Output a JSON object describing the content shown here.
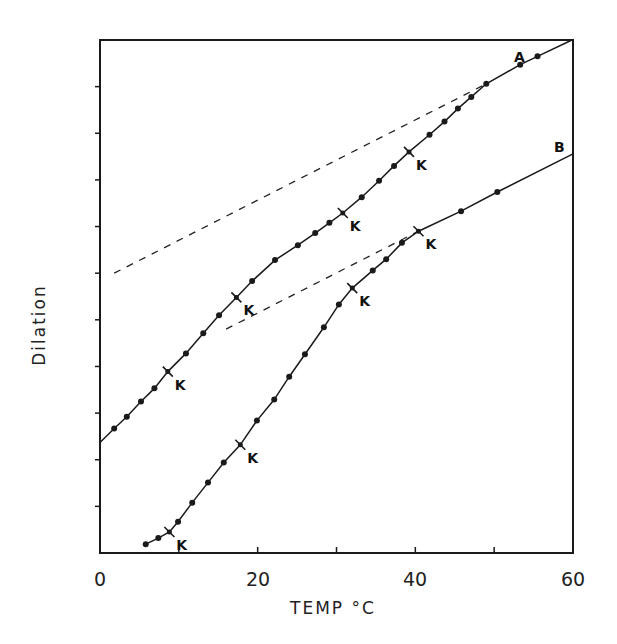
{
  "chart_data": {
    "type": "line",
    "title": "",
    "xlabel": "TEMP °C",
    "ylabel": "Dilation",
    "xlim": [
      0,
      60
    ],
    "ylim": [
      0,
      11
    ],
    "x_ticks": [
      0,
      10,
      20,
      30,
      40,
      50,
      60
    ],
    "x_tick_labels": [
      "0",
      "20",
      "40",
      "60"
    ],
    "x_tick_label_values": [
      0,
      20,
      40,
      60
    ],
    "y_ticks": [
      1,
      2,
      3,
      4,
      5,
      6,
      7,
      8,
      9,
      10
    ],
    "y_tick_labels": [],
    "grid": false,
    "legend": "none (curves labeled inline)",
    "series": [
      {
        "name": "A",
        "style": "solid line with dot markers",
        "x": [
          0,
          1.8,
          3.4,
          5.2,
          6.9,
          8.6,
          10.9,
          13.1,
          15.1,
          17.3,
          19.3,
          22.2,
          25.1,
          27.3,
          29.1,
          30.8,
          33.2,
          35.4,
          37.3,
          39.2,
          41.8,
          43.7,
          45.4,
          47.1,
          49.0,
          53.3,
          55.5,
          60
        ],
        "y": [
          2.37,
          2.67,
          2.92,
          3.25,
          3.53,
          3.89,
          4.28,
          4.71,
          5.1,
          5.48,
          5.83,
          6.28,
          6.6,
          6.86,
          7.08,
          7.29,
          7.63,
          7.98,
          8.3,
          8.6,
          8.97,
          9.25,
          9.53,
          9.78,
          10.06,
          10.47,
          10.65,
          11.01
        ],
        "markers_at_index": [
          1,
          2,
          3,
          4,
          6,
          7,
          8,
          10,
          11,
          12,
          13,
          14,
          16,
          17,
          18,
          20,
          21,
          22,
          23,
          24,
          25,
          26
        ],
        "k_points": [
          {
            "x": 8.6,
            "y": 3.89
          },
          {
            "x": 17.3,
            "y": 5.48
          },
          {
            "x": 30.8,
            "y": 7.29
          },
          {
            "x": 39.2,
            "y": 8.6
          }
        ]
      },
      {
        "name": "B",
        "style": "solid line with dot markers",
        "x": [
          5.8,
          7.4,
          8.8,
          9.9,
          11.7,
          13.7,
          15.7,
          17.8,
          19.9,
          22.1,
          24.0,
          26.0,
          28.4,
          30.3,
          32.0,
          34.6,
          36.3,
          38.3,
          40.4,
          45.8,
          50.4,
          60
        ],
        "y": [
          0.19,
          0.32,
          0.45,
          0.67,
          1.08,
          1.51,
          1.94,
          2.32,
          2.84,
          3.29,
          3.78,
          4.26,
          4.84,
          5.33,
          5.68,
          6.06,
          6.3,
          6.65,
          6.9,
          7.33,
          7.74,
          8.56
        ],
        "markers_at_index": [
          0,
          1,
          3,
          4,
          5,
          6,
          8,
          9,
          10,
          11,
          12,
          13,
          15,
          16,
          17,
          19,
          20
        ],
        "k_points": [
          {
            "x": 8.8,
            "y": 0.45
          },
          {
            "x": 17.8,
            "y": 2.32
          },
          {
            "x": 32.0,
            "y": 5.68
          },
          {
            "x": 40.4,
            "y": 6.9
          }
        ]
      },
      {
        "name": "A extrapolation",
        "style": "dashed",
        "x": [
          1.8,
          49.0
        ],
        "y": [
          6.0,
          10.06
        ]
      },
      {
        "name": "B extrapolation",
        "style": "dashed",
        "x": [
          16.0,
          40.4
        ],
        "y": [
          4.8,
          6.9
        ]
      }
    ],
    "annotations": [
      {
        "text": "A",
        "x": 53.0,
        "y": 10.7
      },
      {
        "text": "B",
        "x": 58.2,
        "y": 8.8
      },
      {
        "text": "K",
        "note": "transition points marked with cross ticks on both curves"
      }
    ]
  },
  "labels": {
    "xlabel": "TEMP °C",
    "ylabel": "Dilation",
    "curve_a": "A",
    "curve_b": "B",
    "k": "K",
    "x0": "0",
    "x20": "20",
    "x40": "40",
    "x60": "60"
  }
}
